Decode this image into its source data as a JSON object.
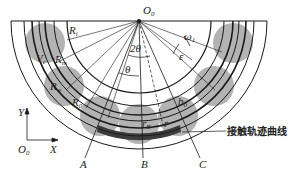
{
  "figure": {
    "center_label": "O",
    "center_sub": "0",
    "origin_label": "O",
    "origin_sub": "0",
    "axis_x": "X",
    "axis_y": "Y",
    "radii_labels": {
      "Ri": "R",
      "Ri_sub": "i",
      "Rm": "R",
      "Rm_sub": "m",
      "Rw": "R",
      "Rw_sub": "w",
      "R0": "R",
      "R0_sub": "0"
    },
    "angle_labels": {
      "two_theta": "2θ",
      "theta": "θ",
      "epsilon": "ε",
      "omega": "ω",
      "omega_sub": "1"
    },
    "velocity_label": "V",
    "velocity_sub": "c",
    "b0_label": "b",
    "b0_sub": "0",
    "rB_label": "r",
    "rB_sub": "B",
    "r_label": "r",
    "ray_labels": [
      "A",
      "B",
      "C"
    ],
    "callout": "接触轨迹曲线"
  },
  "colors": {
    "ball_fill": "#9a9a9a",
    "contact_band": "#3c3c3c",
    "line": "#1a1a1a"
  }
}
